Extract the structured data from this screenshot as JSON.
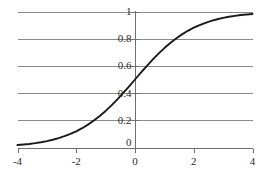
{
  "chart_data": {
    "type": "line",
    "title": "",
    "subtitle": "",
    "xlabel": "",
    "ylabel": "",
    "xlim": [
      -4,
      4
    ],
    "ylim": [
      0,
      1
    ],
    "grid": "horizontal",
    "legend": "none",
    "xticks": [
      -4,
      -2,
      0,
      2,
      4
    ],
    "xticklabels": [
      "-4",
      "-2",
      "0",
      "2",
      "4"
    ],
    "yticks": [
      0,
      0.2,
      0.4,
      0.6,
      0.8,
      1
    ],
    "yticklabels": [
      "0",
      "0.2",
      "0.4",
      "0.6",
      "0.8",
      "1"
    ],
    "series": [
      {
        "name": "logistic sigmoid",
        "formula": "1 / (1 + exp(-x))",
        "color": "#1a1a1a",
        "x": [
          -4,
          -3.8,
          -3.6,
          -3.4,
          -3.2,
          -3,
          -2.8,
          -2.6,
          -2.4,
          -2.2,
          -2,
          -1.8,
          -1.6,
          -1.4,
          -1.2,
          -1,
          -0.8,
          -0.6,
          -0.4,
          -0.2,
          0,
          0.2,
          0.4,
          0.6,
          0.8,
          1,
          1.2,
          1.4,
          1.6,
          1.8,
          2,
          2.2,
          2.4,
          2.6,
          2.8,
          3,
          3.2,
          3.4,
          3.6,
          3.8,
          4
        ],
        "values": [
          0.018,
          0.022,
          0.026,
          0.032,
          0.039,
          0.047,
          0.057,
          0.069,
          0.083,
          0.1,
          0.119,
          0.142,
          0.168,
          0.198,
          0.231,
          0.269,
          0.31,
          0.354,
          0.401,
          0.45,
          0.5,
          0.55,
          0.599,
          0.646,
          0.69,
          0.731,
          0.769,
          0.802,
          0.832,
          0.858,
          0.881,
          0.9,
          0.917,
          0.931,
          0.943,
          0.953,
          0.961,
          0.968,
          0.974,
          0.978,
          0.982
        ]
      }
    ],
    "colors": {
      "curve": "#1a1a1a",
      "grid": "#8a8a8a",
      "axis": "#6f6f6f",
      "text": "#2b2b2b",
      "background": "#ffffff"
    }
  }
}
